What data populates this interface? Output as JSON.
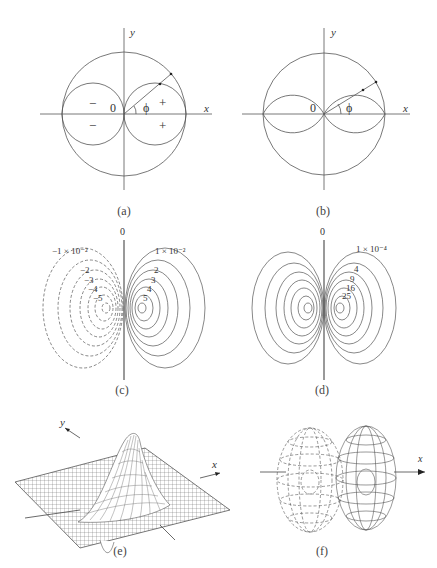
{
  "figure": {
    "panels": [
      {
        "id": "a",
        "caption": "(a)",
        "axis_x": "x",
        "axis_y": "y",
        "origin": "0",
        "angle": "ϕ",
        "signs": [
          "−",
          "+",
          "−",
          "+"
        ]
      },
      {
        "id": "b",
        "caption": "(b)",
        "axis_x": "x",
        "axis_y": "y",
        "origin": "0",
        "angle": "ϕ"
      },
      {
        "id": "c",
        "caption": "(c)",
        "top_label": "0",
        "neg_labels": [
          "−1 × 10⁻²",
          "−2",
          "−3",
          "−4",
          "−5"
        ],
        "pos_labels": [
          "1 × 10⁻²",
          "2",
          "3",
          "4",
          "5"
        ]
      },
      {
        "id": "d",
        "caption": "(d)",
        "top_label": "0",
        "labels": [
          "1 × 10⁻⁴",
          "4",
          "9",
          "16",
          "25"
        ]
      },
      {
        "id": "e",
        "caption": "(e)",
        "axis_x": "x",
        "axis_y": "y"
      },
      {
        "id": "f",
        "caption": "(f)",
        "axis_x": "x"
      }
    ]
  }
}
